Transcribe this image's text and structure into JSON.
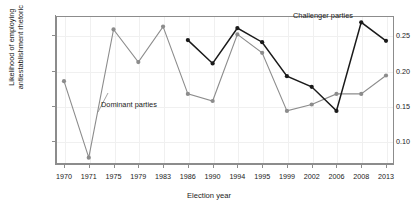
{
  "chart_data": {
    "type": "line",
    "title": "",
    "xlabel": "Election year",
    "ylabel": "Likelihood of employing antiestablishment rhetoric",
    "ylabel_line1": "Likelihood of employing",
    "ylabel_line2": "antiestablishment rhetoric",
    "categories": [
      "1970",
      "1971",
      "1975",
      "1979",
      "1983",
      "1986",
      "1990",
      "1994",
      "1995",
      "1999",
      "2002",
      "2006",
      "2008",
      "2013"
    ],
    "x_ticks": [
      "1970",
      "1971",
      "1975",
      "1979",
      "1983",
      "1986",
      "1990",
      "1994",
      "1995",
      "1999",
      "2002",
      "2006",
      "2008",
      "2013"
    ],
    "y_ticks": [
      "0.10",
      "0.15",
      "0.20",
      "0.25"
    ],
    "y_tick_values": [
      0.1,
      0.15,
      0.2,
      0.25
    ],
    "ylim": [
      0.068,
      0.277
    ],
    "xlim_index": [
      0,
      13
    ],
    "grid": true,
    "legend_position": "inline-annotations",
    "series": [
      {
        "name": "Dominant parties",
        "color": "#8c8c8c",
        "marker": "circle",
        "values": [
          0.185,
          0.077,
          0.258,
          0.212,
          0.262,
          0.167,
          0.157,
          0.251,
          0.225,
          0.143,
          0.152,
          0.167,
          0.167,
          0.193
        ]
      },
      {
        "name": "Challenger parties",
        "color": "#1a1a1a",
        "marker": "circle",
        "values": [
          null,
          null,
          null,
          null,
          null,
          0.243,
          0.21,
          0.26,
          0.24,
          0.192,
          0.177,
          0.143,
          0.268,
          0.242
        ]
      }
    ],
    "annotations": [
      {
        "text": "Dominant parties",
        "near_category": "1979",
        "color": "#1a1a1a"
      },
      {
        "text": "Challenger parties",
        "near_category": "2006",
        "color": "#1a1a1a"
      }
    ]
  },
  "colors": {
    "dominant": "#8c8c8c",
    "challenger": "#1a1a1a",
    "axis": "#8c8c8c",
    "grid": "#f0f0f0",
    "background": "#ffffff"
  }
}
